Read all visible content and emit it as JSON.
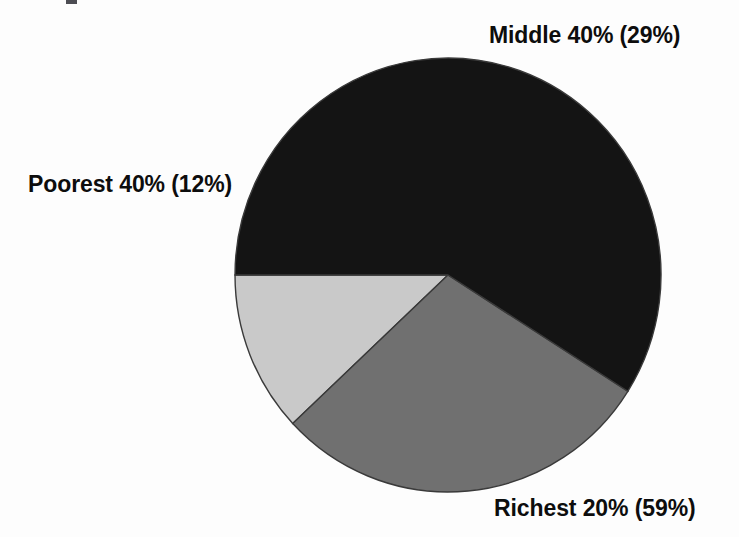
{
  "figure": {
    "background_color": "#fdfdfd",
    "text_color": "#0d0d0d"
  },
  "chart_data": {
    "type": "pie",
    "title": "",
    "subtitle": "",
    "xlabel": "",
    "ylabel": "",
    "grid": false,
    "legend_position": "none",
    "labels_position": "outside",
    "start_angle_deg": 180,
    "direction": "clockwise",
    "total": 100,
    "center": {
      "x": 448,
      "y": 275
    },
    "radius": {
      "x": 213,
      "y": 217
    },
    "categories": [
      "Poorest 40%",
      "Middle 40%",
      "Richest 20%"
    ],
    "values": [
      12,
      29,
      59
    ],
    "value_unit": "%",
    "slices": [
      {
        "name": "Poorest 40%",
        "group_label": "Poorest 40%",
        "value": 12,
        "value_text": "(12%)",
        "label": "Poorest 40% (12%)",
        "color": "#c9c9c9",
        "sweep_deg": 43.2,
        "start_deg": 180,
        "end_deg": 223.2
      },
      {
        "name": "Middle 40%",
        "group_label": "Middle 40%",
        "value": 29,
        "value_text": "(29%)",
        "label": "Middle 40% (29%)",
        "color": "#707070",
        "sweep_deg": 104.4,
        "start_deg": 223.2,
        "end_deg": 327.6
      },
      {
        "name": "Richest 20%",
        "group_label": "Richest 20%",
        "value": 59,
        "value_text": "(59%)",
        "label": "Richest 20% (59%)",
        "color": "#141414",
        "sweep_deg": 212.4,
        "start_deg": 327.6,
        "end_deg": 180
      }
    ],
    "annotations": []
  },
  "labels": {
    "middle": "Middle 40% (29%)",
    "poorest": "Poorest 40% (12%)",
    "richest": "Richest 20% (59%)"
  }
}
